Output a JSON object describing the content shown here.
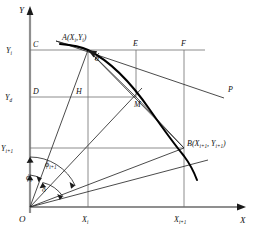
{
  "figure": {
    "type": "geometry-diagram",
    "axes": {
      "x_label": "X",
      "y_label": "Y",
      "origin_label": "O"
    },
    "x_ticks": [
      {
        "id": "xi",
        "label": "X",
        "sub": "i",
        "px": 88
      },
      {
        "id": "xi1",
        "label": "X",
        "sub": "i+1",
        "px": 184
      }
    ],
    "y_ticks": [
      {
        "id": "yi",
        "label": "Y",
        "sub": "i",
        "px": 50
      },
      {
        "id": "yd",
        "label": "Y",
        "sub": "d",
        "px": 97
      },
      {
        "id": "yi1",
        "label": "Y",
        "sub": "i+1",
        "px": 148
      }
    ],
    "points": [
      {
        "id": "A",
        "label": "A(X",
        "sub1": "i",
        "mid": ",Y",
        "sub2": "i",
        "tail": ")",
        "x": 88,
        "y": 50
      },
      {
        "id": "B",
        "label": "B(X",
        "sub1": "i+1",
        "mid": ", Y",
        "sub2": "i+1",
        "tail": ")",
        "x": 184,
        "y": 148
      },
      {
        "id": "C",
        "label": "C",
        "x": 30,
        "y": 50
      },
      {
        "id": "D",
        "label": "D",
        "x": 30,
        "y": 97
      },
      {
        "id": "E",
        "label": "E",
        "x": 136,
        "y": 50
      },
      {
        "id": "F",
        "label": "F",
        "x": 184,
        "y": 50
      },
      {
        "id": "H",
        "label": "H",
        "x": 88,
        "y": 97
      },
      {
        "id": "M",
        "label": "M",
        "x": 136,
        "y": 97
      },
      {
        "id": "P",
        "label": "P",
        "x": 228,
        "y": 93
      },
      {
        "id": "O",
        "label": "O",
        "x": 30,
        "y": 207
      }
    ],
    "angles": [
      {
        "id": "phi_i",
        "label": "ϕ",
        "sub": "i",
        "desc": "angle-phi-i"
      },
      {
        "id": "phi_i1",
        "label": "ϕ",
        "sub": "i+1",
        "desc": "angle-phi-i-plus-1"
      },
      {
        "id": "delta",
        "label": "δ",
        "sub": "",
        "desc": "angle-delta"
      },
      {
        "id": "alpha",
        "label": "α",
        "sub": "",
        "desc": "angle-alpha-at-A"
      }
    ],
    "colors": {
      "line": "#1a1a1a",
      "grid": "#6e6e6e",
      "axis": "#8a8a8a",
      "curve": "#000000",
      "background": "#ffffff"
    }
  }
}
